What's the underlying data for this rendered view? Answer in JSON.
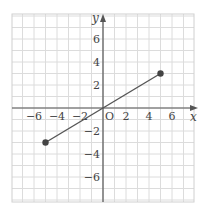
{
  "chart_data": {
    "type": "line",
    "title": "",
    "xlabel": "x",
    "ylabel": "y",
    "origin_label": "O",
    "xlim": [
      -8,
      8
    ],
    "ylim": [
      -8,
      8
    ],
    "grid": true,
    "x_ticks": [
      -6,
      -4,
      -2,
      2,
      4,
      6
    ],
    "y_ticks": [
      6,
      4,
      2,
      -2,
      -4,
      -6
    ],
    "x_tick_labels": [
      "−6",
      "−4",
      "−2",
      "2",
      "4",
      "6"
    ],
    "y_tick_labels": [
      "6",
      "4",
      "2",
      "−2",
      "−4",
      "−6"
    ],
    "series": [
      {
        "name": "segment",
        "x": [
          -5,
          5
        ],
        "y": [
          -3,
          3
        ],
        "endpoints_marked": true
      }
    ],
    "colors": {
      "grid": "#dcdcdc",
      "axis": "#555555",
      "line": "#555555",
      "point": "#444444"
    }
  }
}
